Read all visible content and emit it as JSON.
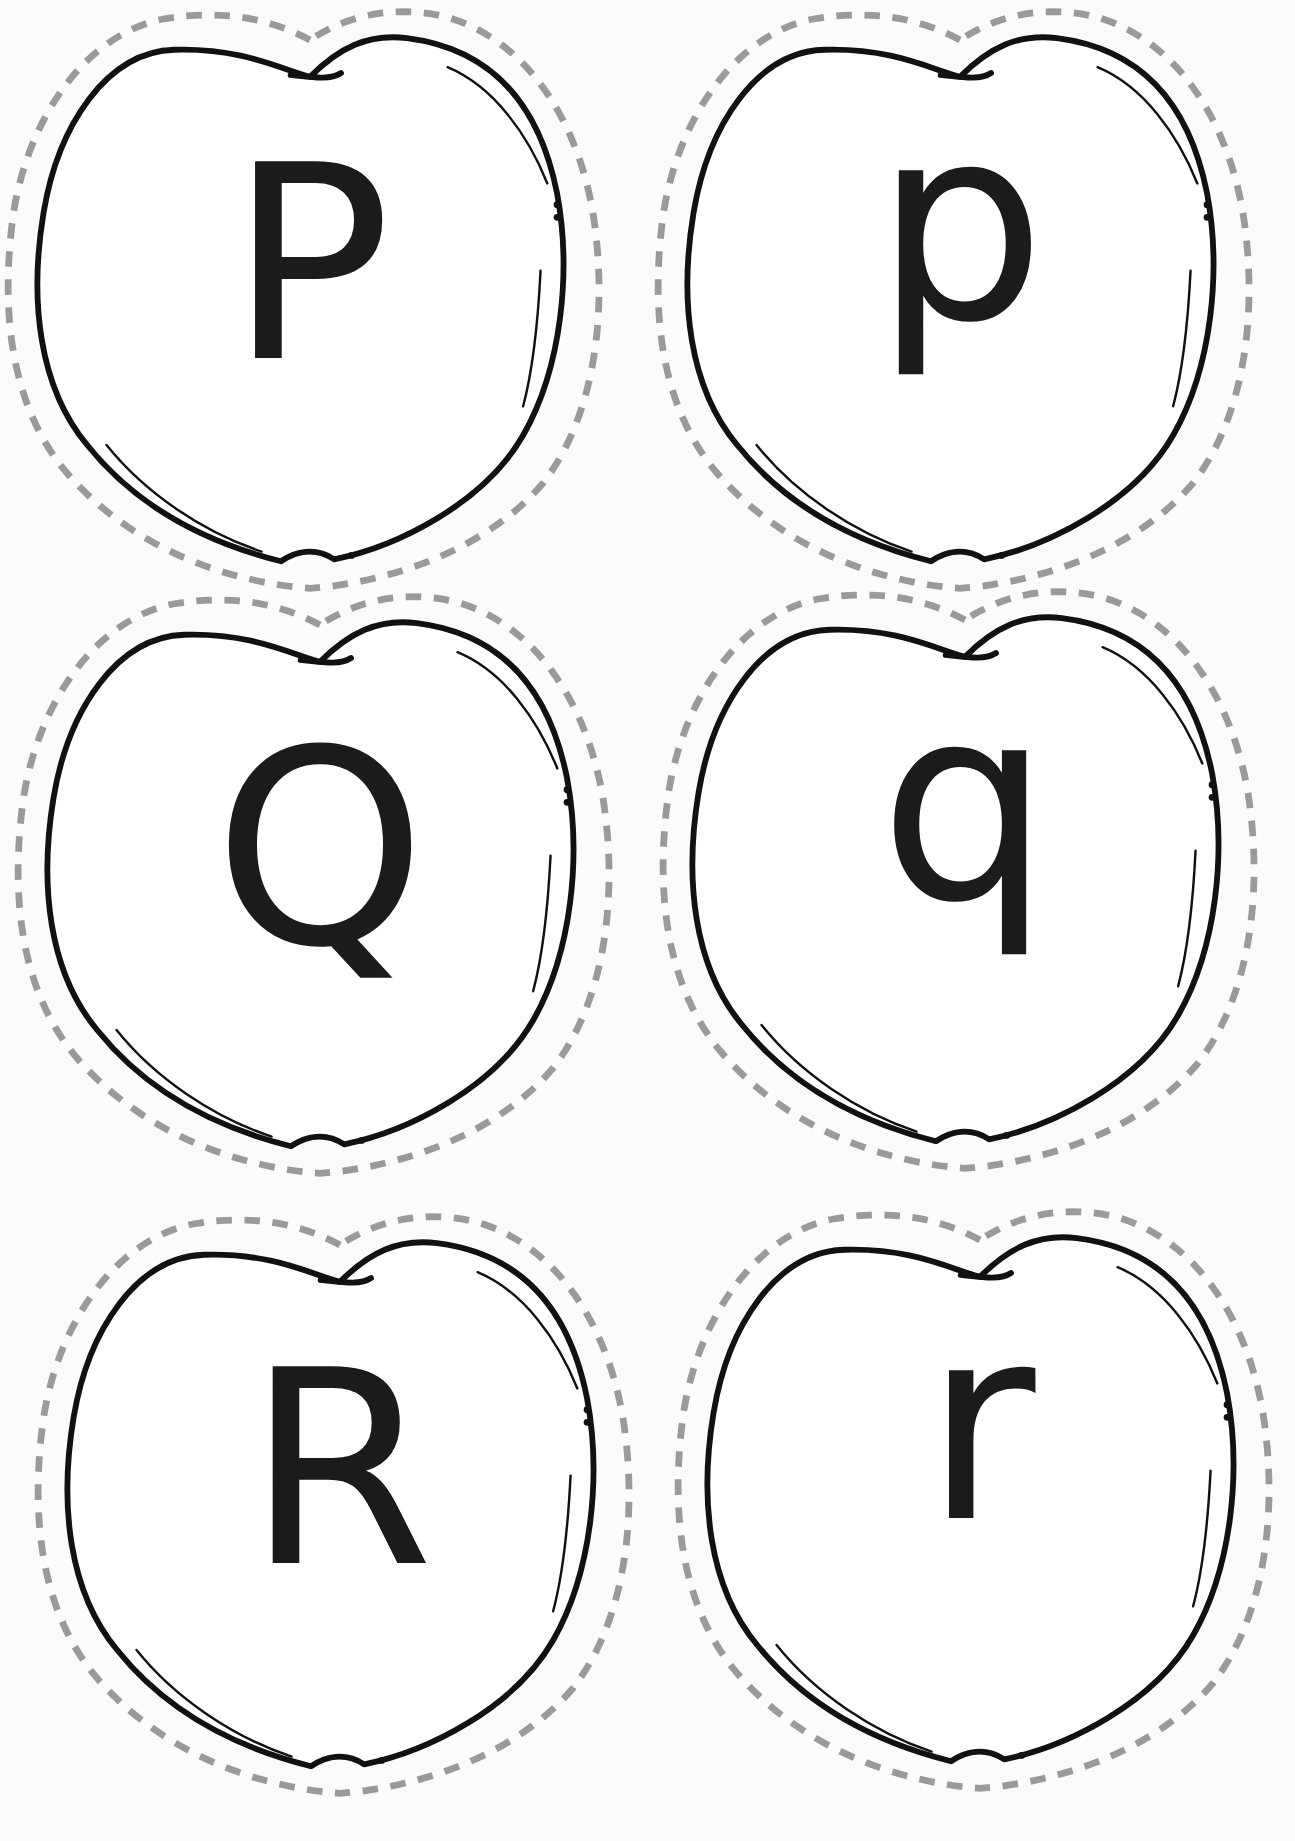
{
  "worksheet": {
    "type": "letter apple cards",
    "colors": {
      "outline": "#111111",
      "cut_line": "#9a9a9a",
      "letter": "#1b1b1b",
      "background": "#fbfbfb"
    },
    "cards": [
      {
        "letter": "P",
        "case": "uppercase",
        "row": 1,
        "col": 1
      },
      {
        "letter": "p",
        "case": "lowercase",
        "row": 1,
        "col": 2
      },
      {
        "letter": "Q",
        "case": "uppercase",
        "row": 2,
        "col": 1
      },
      {
        "letter": "q",
        "case": "lowercase",
        "row": 2,
        "col": 2
      },
      {
        "letter": "R",
        "case": "uppercase",
        "row": 3,
        "col": 1
      },
      {
        "letter": "r",
        "case": "lowercase",
        "row": 3,
        "col": 2
      }
    ]
  }
}
